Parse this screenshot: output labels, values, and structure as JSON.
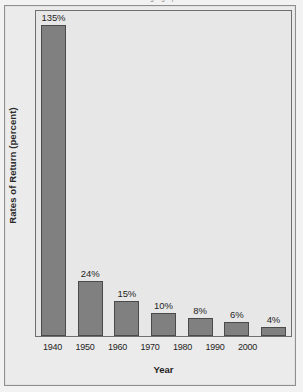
{
  "chart_data": {
    "type": "bar",
    "title": "",
    "xlabel": "Year",
    "ylabel": "Rates of Return (percent)",
    "categories": [
      "1940",
      "1950",
      "1960",
      "1970",
      "1980",
      "1990",
      "2000"
    ],
    "values": [
      135,
      24,
      15,
      10,
      8,
      6,
      4
    ],
    "value_labels": [
      "135%",
      "24%",
      "15%",
      "10%",
      "8%",
      "6%",
      "4%"
    ],
    "ylim": [
      0,
      135
    ],
    "grid": false,
    "legend": null,
    "colors": {
      "bar_fill": "#808080",
      "bar_border": "#4a4a4a",
      "plot_background": "#e7e7e7",
      "page_background": "#ebebeb",
      "text": "#1f1f1f"
    }
  },
  "page": {
    "top_cut_text": "g   ·  g    ·  p"
  }
}
